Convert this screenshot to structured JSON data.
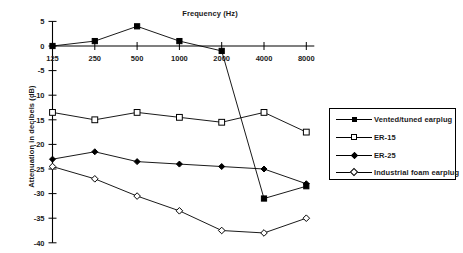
{
  "chart_data": {
    "type": "line",
    "title": "Frequency (Hz)",
    "xlabel": "Frequency (Hz)",
    "ylabel": "Attenuation in decibels (dB)",
    "categories": [
      "125",
      "250",
      "500",
      "1000",
      "2000",
      "4000",
      "8000"
    ],
    "x_tick_labels": [
      "125",
      "250",
      "500",
      "1000",
      "2000",
      "4000",
      "8000"
    ],
    "y_tick_labels": [
      "5",
      "0",
      "-5",
      "-10",
      "-15",
      "-20",
      "-25",
      "-30",
      "-35",
      "-40"
    ],
    "ylim": [
      -40,
      5
    ],
    "grid": false,
    "legend_position": "right",
    "series": [
      {
        "name": "Vented/tuned earplug",
        "marker": "square-filled",
        "values": [
          0,
          1,
          4,
          1,
          -1,
          -31,
          -28.5
        ]
      },
      {
        "name": "ER-15",
        "marker": "square-open",
        "values": [
          -13.5,
          -15,
          -13.5,
          -14.5,
          -15.5,
          -13.5,
          -17.5
        ]
      },
      {
        "name": "ER-25",
        "marker": "diamond-filled",
        "values": [
          -23,
          -21.5,
          -23.5,
          -24,
          -24.5,
          -25,
          -28
        ]
      },
      {
        "name": "Industrial foam earplug",
        "marker": "diamond-open",
        "values": [
          -24.5,
          -27,
          -30.5,
          -33.5,
          -37.5,
          -38,
          -35
        ]
      }
    ]
  },
  "colors": {
    "line": "#000000",
    "text": "#1a1a1a",
    "background": "#ffffff"
  }
}
